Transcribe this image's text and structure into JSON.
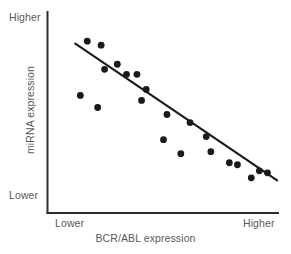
{
  "chart_data": {
    "type": "scatter",
    "title": "",
    "xlabel": "BCR/ABL expression",
    "ylabel": "miRNA expression",
    "x_tick_labels": [
      "Lower",
      "Higher"
    ],
    "y_tick_labels": [
      "Lower",
      "Higher"
    ],
    "xlim": [
      0,
      100
    ],
    "ylim": [
      0,
      100
    ],
    "grid": false,
    "legend": null,
    "annotations": [],
    "series": [
      {
        "name": "samples",
        "marker": "filled-circle",
        "color": "#1a1a1a",
        "points": [
          {
            "x": 17.0,
            "y": 85.5
          },
          {
            "x": 23.0,
            "y": 83.5
          },
          {
            "x": 30.0,
            "y": 74.0
          },
          {
            "x": 24.5,
            "y": 71.5
          },
          {
            "x": 34.0,
            "y": 69.0
          },
          {
            "x": 38.5,
            "y": 69.0
          },
          {
            "x": 14.0,
            "y": 58.5
          },
          {
            "x": 21.5,
            "y": 52.5
          },
          {
            "x": 42.5,
            "y": 61.5
          },
          {
            "x": 40.5,
            "y": 56.0
          },
          {
            "x": 51.5,
            "y": 49.0
          },
          {
            "x": 61.5,
            "y": 45.0
          },
          {
            "x": 50.0,
            "y": 36.5
          },
          {
            "x": 68.5,
            "y": 38.0
          },
          {
            "x": 57.5,
            "y": 29.5
          },
          {
            "x": 70.5,
            "y": 30.5
          },
          {
            "x": 78.5,
            "y": 25.0
          },
          {
            "x": 82.0,
            "y": 24.0
          },
          {
            "x": 88.0,
            "y": 17.5
          },
          {
            "x": 91.5,
            "y": 21.0
          },
          {
            "x": 95.0,
            "y": 20.0
          }
        ]
      }
    ],
    "trendline": {
      "name": "regression-line",
      "color": "#1a1a1a",
      "start": {
        "x": 11.5,
        "y": 84.5
      },
      "end": {
        "x": 99.5,
        "y": 16.0
      }
    }
  },
  "axes": {
    "y_top_label": "Higher",
    "y_bottom_label": "Lower",
    "x_left_label": "Lower",
    "x_right_label": "Higher",
    "x_title": "BCR/ABL expression",
    "y_title": "miRNA expression",
    "axis_color": "#2b2b2b",
    "label_color": "#58595b"
  }
}
